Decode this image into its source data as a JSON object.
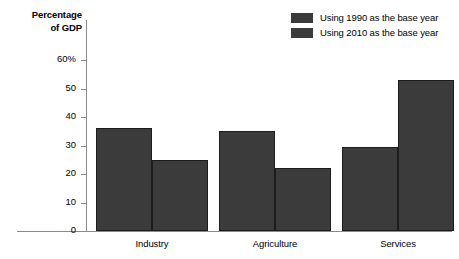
{
  "chart_data": {
    "type": "bar",
    "title": "",
    "subtitle": "",
    "xlabel": "",
    "ylabel": "Percentage of GDP",
    "ylabel_line1": "Percentage",
    "ylabel_line2": "of GDP",
    "categories": [
      "Industry",
      "Agriculture",
      "Services"
    ],
    "series": [
      {
        "name": "Using 1990 as the base year",
        "values": [
          36,
          35,
          29.5
        ],
        "color": "#3b3b3b"
      },
      {
        "name": "Using 2010 as the base year",
        "values": [
          25,
          22,
          53
        ],
        "color": "#3b3b3b"
      }
    ],
    "ylim": [
      0,
      60
    ],
    "yticks": [
      0,
      10,
      20,
      30,
      40,
      50,
      60
    ],
    "ytick_labels": [
      "0",
      "10",
      "20",
      "30",
      "40",
      "50",
      "60%"
    ],
    "grid": false,
    "legend_position": "top-right",
    "axis_color": "#8a8a8a",
    "bar_edge_color": "#1c1c1c",
    "background": "#ffffff"
  },
  "legend": {
    "items": [
      {
        "label": "Using 1990 as the base year"
      },
      {
        "label": "Using 2010 as the base year"
      }
    ]
  }
}
